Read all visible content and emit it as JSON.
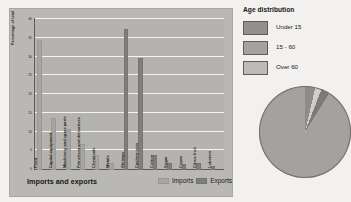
{
  "chart_data": [
    {
      "type": "bar",
      "title": "Imports and exports",
      "xlabel": "",
      "ylabel": "Percentage of total",
      "ylim": [
        0,
        40
      ],
      "yticks": [
        0,
        5,
        10,
        15,
        20,
        25,
        30,
        35,
        40
      ],
      "grid": true,
      "legend_position": "bottom-right",
      "legend": [
        "Imports",
        "Exports"
      ],
      "categories": [
        "Food",
        "Capital equipment",
        "Machinery and spare parts",
        "Petroleum and derivatives",
        "Chemicals",
        "Metals",
        "Shrimps",
        "Cashew nuts",
        "Cotton",
        "Sugar",
        "Copra",
        "Citrus fruit",
        "Lobsters"
      ],
      "series": [
        {
          "name": "Imports",
          "values": [
            35,
            14,
            11,
            7,
            4,
            2,
            0,
            0,
            0,
            0,
            0,
            0,
            0
          ]
        },
        {
          "name": "Exports",
          "values": [
            0,
            0,
            0,
            0,
            0,
            2,
            38,
            30,
            4,
            2,
            1.5,
            2,
            1
          ]
        }
      ]
    },
    {
      "type": "pie",
      "title": "Age distribution",
      "labels": [
        "Under 15",
        "15 - 60",
        "Over 60"
      ],
      "values": [
        9,
        88,
        3
      ],
      "legend_position": "top",
      "note": "pie cropped at right image edge"
    }
  ],
  "bar_panel": {
    "title": "Imports and exports",
    "y_axis_label": "Percentage of total",
    "y_ticks": [
      "40",
      "35",
      "30",
      "25",
      "20",
      "15",
      "10",
      "5",
      "0"
    ],
    "legend": {
      "imports_label": "Imports",
      "exports_label": "Exports"
    },
    "bars": [
      {
        "label": "Food",
        "imports": 35,
        "exports": 0
      },
      {
        "label": "Capital equipment",
        "imports": 14,
        "exports": 0
      },
      {
        "label": "Machinery and spare parts",
        "imports": 11,
        "exports": 0
      },
      {
        "label": "Petroleum and derivatives",
        "imports": 7,
        "exports": 0
      },
      {
        "label": "Chemicals",
        "imports": 4,
        "exports": 0
      },
      {
        "label": "Metals",
        "imports": 2,
        "exports": 0
      },
      {
        "label": "Shrimps",
        "imports": 0,
        "exports": 38
      },
      {
        "label": "Cashew nuts",
        "imports": 0,
        "exports": 30
      },
      {
        "label": "Cotton",
        "imports": 0,
        "exports": 4
      },
      {
        "label": "Sugar",
        "imports": 0,
        "exports": 2
      },
      {
        "label": "Copra",
        "imports": 0,
        "exports": 1.5
      },
      {
        "label": "Citrus fruit",
        "imports": 0,
        "exports": 2
      },
      {
        "label": "Lobsters",
        "imports": 0,
        "exports": 1
      }
    ]
  },
  "age_panel": {
    "title": "Age distribution",
    "keys": [
      {
        "label": "Under 15"
      },
      {
        "label": "15 - 60"
      },
      {
        "label": "Over 60"
      }
    ]
  },
  "colors": {
    "imports_swatch": "#a6a5a1",
    "exports_swatch": "#807f7c",
    "panel_bg": "#b9b8b4",
    "page_bg": "#f2f1ef",
    "gridline": "#f4f3f1",
    "axis": "#5d5c59"
  }
}
